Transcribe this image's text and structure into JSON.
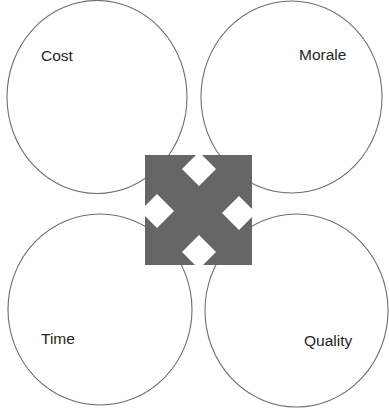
{
  "diagram": {
    "title": "",
    "type": "four-circle quadrant diagram with central four-way arrow",
    "colors": {
      "background": "#ffffff",
      "circle_stroke": "#6e6e6e",
      "arrow_fill": "#666666",
      "text": "#262626"
    },
    "quadrants": [
      {
        "position": "top-left",
        "label": "Cost"
      },
      {
        "position": "top-right",
        "label": "Morale"
      },
      {
        "position": "bottom-left",
        "label": "Time"
      },
      {
        "position": "bottom-right",
        "label": "Quality"
      }
    ],
    "center_icon": "four-way-arrow-icon"
  }
}
